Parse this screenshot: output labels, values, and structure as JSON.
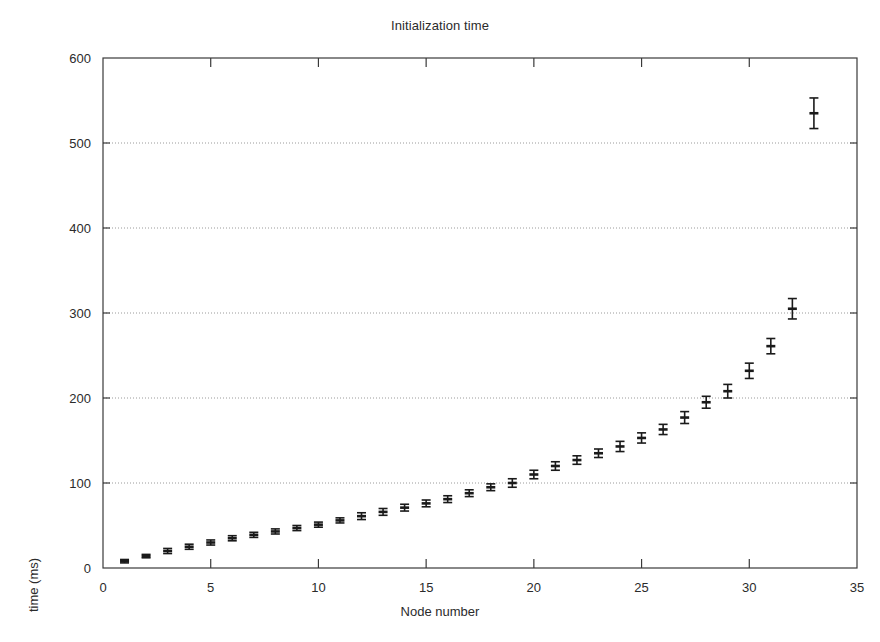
{
  "chart_data": {
    "type": "scatter",
    "title": "Initialization time",
    "xlabel": "Node number",
    "ylabel": "time (ms)",
    "xlim": [
      0,
      35
    ],
    "ylim": [
      0,
      600
    ],
    "xticks": [
      0,
      5,
      10,
      15,
      20,
      25,
      30,
      35
    ],
    "yticks": [
      0,
      100,
      200,
      300,
      400,
      500,
      600
    ],
    "grid": "horizontal-dotted",
    "gridlines_y": [
      100,
      200,
      300,
      400,
      500
    ],
    "legend": null,
    "marker": "point-with-vertical-error-bars",
    "series": [
      {
        "name": "Initialization time",
        "x": [
          1,
          2,
          3,
          4,
          5,
          6,
          7,
          8,
          9,
          10,
          11,
          12,
          13,
          14,
          15,
          16,
          17,
          18,
          19,
          20,
          21,
          22,
          23,
          24,
          25,
          26,
          27,
          28,
          29,
          30,
          31,
          32,
          33
        ],
        "values": [
          8,
          14,
          20,
          25,
          30,
          35,
          39,
          43,
          47,
          51,
          56,
          61,
          66,
          71,
          76,
          81,
          88,
          95,
          100,
          110,
          120,
          127,
          135,
          143,
          153,
          163,
          177,
          195,
          208,
          232,
          261,
          305,
          535
        ],
        "yerr": [
          2,
          2,
          3,
          3,
          3,
          3,
          3,
          3,
          3,
          3,
          3,
          4,
          4,
          4,
          4,
          4,
          4,
          4,
          5,
          5,
          5,
          5,
          5,
          6,
          6,
          6,
          7,
          7,
          8,
          9,
          9,
          12,
          18
        ]
      }
    ]
  },
  "figure": {
    "title": "Initialization time",
    "xlabel": "Node number",
    "ylabel": "time (ms)",
    "caption": ""
  },
  "colors": {
    "ink": "#1a1a1a",
    "axis": "#3a3a3a",
    "grid": "#9a9a9a",
    "background": "#ffffff"
  }
}
